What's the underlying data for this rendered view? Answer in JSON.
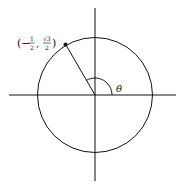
{
  "diagram": {
    "type": "unit-circle",
    "point_label": {
      "open": "(−",
      "x_num": "1",
      "x_den": "2",
      "sep": ",",
      "y_num": "√3",
      "y_den": "2",
      "close": ")"
    },
    "angle_label": "θ",
    "point": {
      "x": -0.5,
      "y": 0.866
    },
    "angle_degrees": 120,
    "colors": {
      "stroke": "#111111",
      "background": "#ffffff"
    }
  }
}
